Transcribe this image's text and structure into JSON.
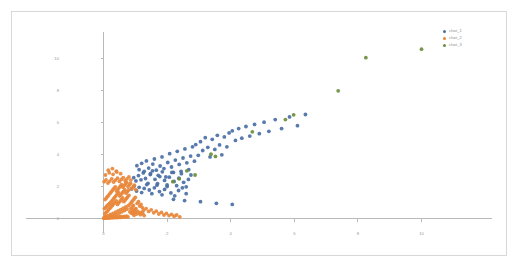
{
  "chart_data": {
    "type": "scatter",
    "title": "",
    "xlabel": "",
    "ylabel": "",
    "xlim": [
      -1,
      12
    ],
    "ylim": [
      -0.6,
      11
    ],
    "grid": false,
    "legend_position": "top-right",
    "xticks": [
      0,
      2,
      4,
      6,
      8,
      10
    ],
    "yticks": [
      0,
      2,
      4,
      6,
      8,
      10
    ],
    "xtick_labels": [
      "0",
      "2",
      "4",
      "6",
      "8",
      "10"
    ],
    "ytick_labels": [
      "0",
      "2",
      "4",
      "6",
      "8",
      "10"
    ],
    "series": [
      {
        "name": "clust_1",
        "color": "#4a6fa5",
        "marker": "circle",
        "points": [
          [
            1.05,
            3.3
          ],
          [
            1.12,
            3.05
          ],
          [
            1.2,
            3.45
          ],
          [
            1.28,
            2.95
          ],
          [
            1.35,
            3.6
          ],
          [
            1.42,
            3.15
          ],
          [
            1.48,
            2.8
          ],
          [
            1.55,
            3.4
          ],
          [
            1.6,
            3.72
          ],
          [
            1.66,
            3.02
          ],
          [
            1.72,
            2.7
          ],
          [
            1.78,
            3.28
          ],
          [
            1.84,
            3.85
          ],
          [
            1.9,
            3.12
          ],
          [
            1.96,
            2.6
          ],
          [
            2.02,
            3.5
          ],
          [
            2.08,
            4.05
          ],
          [
            2.14,
            3.22
          ],
          [
            2.2,
            2.88
          ],
          [
            2.26,
            3.65
          ],
          [
            2.32,
            4.2
          ],
          [
            2.38,
            3.38
          ],
          [
            2.44,
            2.95
          ],
          [
            2.5,
            3.78
          ],
          [
            2.56,
            4.35
          ],
          [
            2.62,
            3.48
          ],
          [
            2.68,
            3.05
          ],
          [
            2.74,
            3.9
          ],
          [
            2.8,
            4.48
          ],
          [
            2.86,
            3.58
          ],
          [
            0.95,
            2.55
          ],
          [
            1.02,
            2.35
          ],
          [
            1.1,
            2.68
          ],
          [
            1.18,
            2.42
          ],
          [
            1.25,
            2.85
          ],
          [
            1.32,
            2.5
          ],
          [
            1.4,
            2.2
          ],
          [
            1.47,
            2.75
          ],
          [
            1.54,
            2.98
          ],
          [
            1.62,
            2.45
          ],
          [
            1.7,
            2.18
          ],
          [
            1.77,
            2.62
          ],
          [
            1.85,
            2.92
          ],
          [
            1.92,
            2.38
          ],
          [
            2.0,
            2.1
          ],
          [
            2.07,
            2.58
          ],
          [
            2.15,
            2.88
          ],
          [
            2.22,
            2.32
          ],
          [
            2.3,
            2.05
          ],
          [
            2.37,
            2.52
          ],
          [
            2.45,
            2.8
          ],
          [
            2.52,
            2.26
          ],
          [
            2.6,
            1.98
          ],
          [
            2.67,
            2.44
          ],
          [
            2.75,
            2.72
          ],
          [
            2.9,
            4.62
          ],
          [
            2.98,
            3.95
          ],
          [
            3.05,
            4.8
          ],
          [
            3.12,
            4.25
          ],
          [
            3.2,
            5.05
          ],
          [
            3.28,
            4.45
          ],
          [
            3.35,
            3.85
          ],
          [
            3.42,
            4.95
          ],
          [
            3.5,
            4.32
          ],
          [
            3.58,
            5.2
          ],
          [
            3.65,
            4.6
          ],
          [
            3.72,
            3.98
          ],
          [
            3.8,
            5.1
          ],
          [
            3.88,
            4.48
          ],
          [
            3.95,
            5.35
          ],
          [
            0.88,
            1.85
          ],
          [
            0.96,
            2.02
          ],
          [
            1.04,
            1.72
          ],
          [
            1.12,
            1.95
          ],
          [
            1.2,
            1.62
          ],
          [
            1.28,
            1.88
          ],
          [
            1.36,
            2.12
          ],
          [
            1.44,
            1.78
          ],
          [
            1.52,
            1.55
          ],
          [
            1.6,
            1.92
          ],
          [
            1.68,
            2.08
          ],
          [
            1.76,
            1.68
          ],
          [
            1.84,
            1.48
          ],
          [
            1.92,
            1.82
          ],
          [
            2.0,
            2.0
          ],
          [
            2.12,
            1.6
          ],
          [
            2.24,
            1.42
          ],
          [
            2.36,
            1.75
          ],
          [
            2.48,
            1.92
          ],
          [
            2.6,
            1.55
          ],
          [
            4.05,
            5.48
          ],
          [
            4.15,
            4.88
          ],
          [
            4.25,
            5.62
          ],
          [
            4.35,
            5.02
          ],
          [
            4.48,
            5.75
          ],
          [
            4.6,
            5.15
          ],
          [
            4.75,
            5.88
          ],
          [
            4.9,
            5.3
          ],
          [
            5.05,
            6.02
          ],
          [
            5.2,
            5.45
          ],
          [
            3.05,
            1.05
          ],
          [
            3.55,
            0.95
          ],
          [
            4.05,
            0.88
          ],
          [
            2.55,
            1.12
          ],
          [
            2.2,
            1.2
          ],
          [
            5.4,
            6.18
          ],
          [
            5.6,
            5.62
          ],
          [
            5.85,
            6.35
          ],
          [
            6.1,
            5.8
          ],
          [
            6.35,
            6.5
          ]
        ]
      },
      {
        "name": "clust_2",
        "color": "#e8873a",
        "marker": "circle",
        "points": [
          [
            0.02,
            0.05
          ],
          [
            0.06,
            0.12
          ],
          [
            0.1,
            0.04
          ],
          [
            0.14,
            0.18
          ],
          [
            0.18,
            0.09
          ],
          [
            0.22,
            0.25
          ],
          [
            0.26,
            0.14
          ],
          [
            0.3,
            0.32
          ],
          [
            0.34,
            0.2
          ],
          [
            0.38,
            0.4
          ],
          [
            0.42,
            0.26
          ],
          [
            0.46,
            0.48
          ],
          [
            0.5,
            0.34
          ],
          [
            0.54,
            0.56
          ],
          [
            0.58,
            0.42
          ],
          [
            0.62,
            0.64
          ],
          [
            0.66,
            0.5
          ],
          [
            0.7,
            0.72
          ],
          [
            0.74,
            0.58
          ],
          [
            0.78,
            0.8
          ],
          [
            0.04,
            0.28
          ],
          [
            0.08,
            0.38
          ],
          [
            0.12,
            0.46
          ],
          [
            0.16,
            0.56
          ],
          [
            0.2,
            0.64
          ],
          [
            0.24,
            0.74
          ],
          [
            0.28,
            0.82
          ],
          [
            0.32,
            0.92
          ],
          [
            0.36,
            1.0
          ],
          [
            0.4,
            1.1
          ],
          [
            0.44,
            0.88
          ],
          [
            0.48,
            0.98
          ],
          [
            0.52,
            1.08
          ],
          [
            0.56,
            1.18
          ],
          [
            0.6,
            1.28
          ],
          [
            0.64,
            1.05
          ],
          [
            0.68,
            1.15
          ],
          [
            0.72,
            1.25
          ],
          [
            0.76,
            1.35
          ],
          [
            0.8,
            1.45
          ],
          [
            0.03,
            0.62
          ],
          [
            0.07,
            0.7
          ],
          [
            0.11,
            0.78
          ],
          [
            0.15,
            0.86
          ],
          [
            0.19,
            0.94
          ],
          [
            0.23,
            1.02
          ],
          [
            0.27,
            1.12
          ],
          [
            0.31,
            1.22
          ],
          [
            0.35,
            1.32
          ],
          [
            0.39,
            1.42
          ],
          [
            0.43,
            1.52
          ],
          [
            0.47,
            1.62
          ],
          [
            0.51,
            1.4
          ],
          [
            0.55,
            1.5
          ],
          [
            0.59,
            1.6
          ],
          [
            0.63,
            1.7
          ],
          [
            0.67,
            1.8
          ],
          [
            0.71,
            1.58
          ],
          [
            0.75,
            1.68
          ],
          [
            0.79,
            1.78
          ],
          [
            0.84,
            0.92
          ],
          [
            0.88,
            1.02
          ],
          [
            0.92,
            1.12
          ],
          [
            0.96,
            1.22
          ],
          [
            1.0,
            1.32
          ],
          [
            0.86,
            0.62
          ],
          [
            0.9,
            0.72
          ],
          [
            0.94,
            0.82
          ],
          [
            0.98,
            0.52
          ],
          [
            1.02,
            0.62
          ],
          [
            1.06,
            0.95
          ],
          [
            1.1,
            1.05
          ],
          [
            1.14,
            0.78
          ],
          [
            1.18,
            0.88
          ],
          [
            1.22,
            0.68
          ],
          [
            0.05,
            1.18
          ],
          [
            0.09,
            1.28
          ],
          [
            0.13,
            1.38
          ],
          [
            0.17,
            1.48
          ],
          [
            0.21,
            1.58
          ],
          [
            0.25,
            1.68
          ],
          [
            0.29,
            1.78
          ],
          [
            0.33,
            1.88
          ],
          [
            0.37,
            1.98
          ],
          [
            0.41,
            1.72
          ],
          [
            0.45,
            1.82
          ],
          [
            0.49,
            1.92
          ],
          [
            0.53,
            2.02
          ],
          [
            0.57,
            2.12
          ],
          [
            0.61,
            1.96
          ],
          [
            0.65,
            2.06
          ],
          [
            0.69,
            2.16
          ],
          [
            0.73,
            2.26
          ],
          [
            0.77,
            2.0
          ],
          [
            0.81,
            2.1
          ],
          [
            0.85,
            2.2
          ],
          [
            0.89,
            1.88
          ],
          [
            0.93,
            1.98
          ],
          [
            0.97,
            2.08
          ],
          [
            1.01,
            1.8
          ],
          [
            1.26,
            0.52
          ],
          [
            1.34,
            0.62
          ],
          [
            1.42,
            0.44
          ],
          [
            1.5,
            0.54
          ],
          [
            1.58,
            0.36
          ],
          [
            1.66,
            0.46
          ],
          [
            1.74,
            0.28
          ],
          [
            1.82,
            0.38
          ],
          [
            1.9,
            0.22
          ],
          [
            1.98,
            0.32
          ],
          [
            2.06,
            0.18
          ],
          [
            2.14,
            0.26
          ],
          [
            2.22,
            0.14
          ],
          [
            2.3,
            0.22
          ],
          [
            2.4,
            0.1
          ],
          [
            0.02,
            2.3
          ],
          [
            0.08,
            2.42
          ],
          [
            0.14,
            2.22
          ],
          [
            0.2,
            2.34
          ],
          [
            0.26,
            2.48
          ],
          [
            0.32,
            2.28
          ],
          [
            0.38,
            2.4
          ],
          [
            0.44,
            2.52
          ],
          [
            0.5,
            2.32
          ],
          [
            0.56,
            2.44
          ],
          [
            0.62,
            2.56
          ],
          [
            0.68,
            2.36
          ],
          [
            0.74,
            2.48
          ],
          [
            0.8,
            2.6
          ],
          [
            0.86,
            2.4
          ],
          [
            0.01,
            0.01
          ],
          [
            0.05,
            0.02
          ],
          [
            0.09,
            0.06
          ],
          [
            0.13,
            0.02
          ],
          [
            0.17,
            0.07
          ],
          [
            0.21,
            0.03
          ],
          [
            0.25,
            0.08
          ],
          [
            0.29,
            0.04
          ],
          [
            0.33,
            0.09
          ],
          [
            0.37,
            0.05
          ],
          [
            0.41,
            0.1
          ],
          [
            0.45,
            0.06
          ],
          [
            0.49,
            0.11
          ],
          [
            0.53,
            0.07
          ],
          [
            0.57,
            0.12
          ],
          [
            0.61,
            0.08
          ],
          [
            0.65,
            0.13
          ],
          [
            0.69,
            0.09
          ],
          [
            0.73,
            0.14
          ],
          [
            0.77,
            0.1
          ],
          [
            0.92,
            0.3
          ],
          [
            0.96,
            0.2
          ],
          [
            1.0,
            0.38
          ],
          [
            1.04,
            0.28
          ],
          [
            1.08,
            0.44
          ],
          [
            1.12,
            0.34
          ],
          [
            1.16,
            0.24
          ],
          [
            1.2,
            0.4
          ],
          [
            1.24,
            0.3
          ],
          [
            1.28,
            0.18
          ],
          [
            0.83,
            0.42
          ],
          [
            0.87,
            0.34
          ],
          [
            0.91,
            0.5
          ],
          [
            0.95,
            0.42
          ],
          [
            0.99,
            0.58
          ],
          [
            0.06,
            2.72
          ],
          [
            0.18,
            2.86
          ],
          [
            0.3,
            2.76
          ],
          [
            0.42,
            2.9
          ],
          [
            0.54,
            2.8
          ],
          [
            0.15,
            3.02
          ],
          [
            0.28,
            3.12
          ],
          [
            0.4,
            2.96
          ]
        ]
      },
      {
        "name": "clust_3",
        "color": "#6b8e3d",
        "marker": "circle",
        "points": [
          [
            3.38,
            4.02
          ],
          [
            3.52,
            3.88
          ],
          [
            4.68,
            5.42
          ],
          [
            5.72,
            6.18
          ],
          [
            5.98,
            6.48
          ],
          [
            7.38,
            7.98
          ],
          [
            8.25,
            10.05
          ],
          [
            10.0,
            10.58
          ],
          [
            2.62,
            2.98
          ],
          [
            2.88,
            2.72
          ],
          [
            2.38,
            2.48
          ],
          [
            2.18,
            2.3
          ]
        ]
      }
    ]
  },
  "legend": {
    "items": [
      {
        "label": "clust_1",
        "color": "#4a6fa5"
      },
      {
        "label": "clust_2",
        "color": "#e8873a"
      },
      {
        "label": "clust_3",
        "color": "#6b8e3d"
      }
    ]
  }
}
